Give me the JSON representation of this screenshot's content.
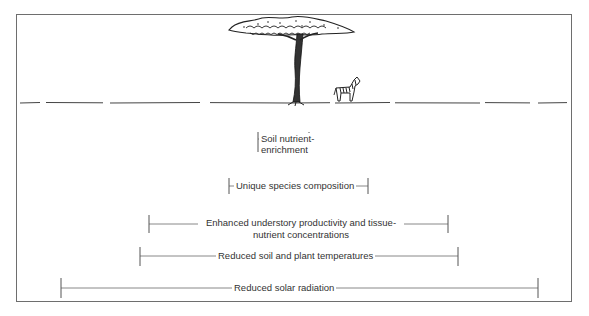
{
  "diagram": {
    "illustration": {
      "tree": "acacia-tree",
      "animal": "zebra",
      "ground": "ground-line"
    },
    "effects": [
      {
        "id": "soil-nutrient-enrichment",
        "lines": [
          "Soil nutrient-",
          "enrichment"
        ],
        "extent": "narrowest"
      },
      {
        "id": "unique-species-composition",
        "lines": [
          "Unique species composition"
        ],
        "extent": "narrow"
      },
      {
        "id": "enhanced-understory-productivity",
        "lines": [
          "Enhanced understory productivity and  tissue-",
          "nutrient concentrations"
        ],
        "extent": "medium"
      },
      {
        "id": "reduced-soil-plant-temperatures",
        "lines": [
          "Reduced soil and plant temperatures"
        ],
        "extent": "wide"
      },
      {
        "id": "reduced-solar-radiation",
        "lines": [
          "Reduced  solar radiation"
        ],
        "extent": "widest"
      }
    ]
  },
  "colors": {
    "frame": "#6e6e6e",
    "ink": "#2a2a2a",
    "background": "#ffffff"
  }
}
